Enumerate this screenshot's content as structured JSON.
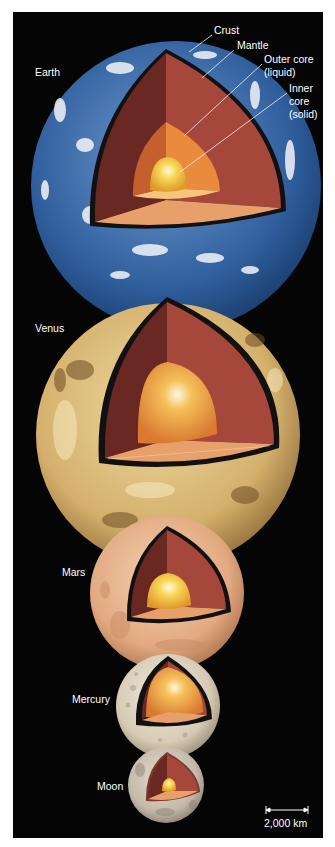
{
  "figure": {
    "background": "#050505",
    "planets": [
      {
        "name": "Earth",
        "label": "Earth",
        "label_pos": [
          35,
          66
        ],
        "center": [
          176,
          186
        ],
        "radius": 145,
        "surface": "#3a6aa8",
        "surface_dark": "#1d3f73"
      },
      {
        "name": "Venus",
        "label": "Venus",
        "label_pos": [
          35,
          322
        ],
        "center": [
          168,
          435
        ],
        "radius": 132,
        "surface": "#d9b774",
        "surface_dark": "#8a6432"
      },
      {
        "name": "Mars",
        "label": "Mars",
        "label_pos": [
          62,
          566
        ],
        "center": [
          167,
          593
        ],
        "radius": 77,
        "surface": "#e2ad85",
        "surface_dark": "#b77a52"
      },
      {
        "name": "Mercury",
        "label": "Mercury",
        "label_pos": [
          72,
          692
        ],
        "center": [
          168,
          706
        ],
        "radius": 52,
        "surface": "#d8cdb8",
        "surface_dark": "#a79b86"
      },
      {
        "name": "Moon",
        "label": "Moon",
        "label_pos": [
          97,
          780
        ],
        "center": [
          166,
          785
        ],
        "radius": 38,
        "surface": "#c9bfb0",
        "surface_dark": "#8f8577"
      }
    ],
    "layer_labels": {
      "crust": "Crust",
      "mantle": "Mantle",
      "outer_core": [
        "Outer core",
        "(liquid)"
      ],
      "inner_core": [
        "Inner",
        "core",
        "(solid)"
      ]
    },
    "layer_colors": {
      "crust_edge": "#111111",
      "mantle_dark": "#6e2a22",
      "mantle": "#a8473a",
      "mantle_floor": "#e59a62",
      "outer_core": "#e8883a",
      "outer_core_floor": "#f5c27a",
      "inner_core": "#f6d24a",
      "inner_core_highlight": "#fffbe0"
    },
    "scale_bar": {
      "label": "2,000 km",
      "km": 2000
    }
  }
}
